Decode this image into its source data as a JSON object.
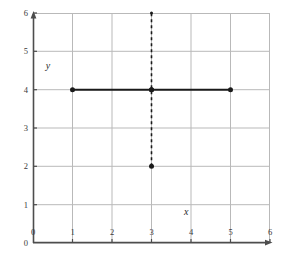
{
  "figure": {
    "width": 283,
    "height": 258,
    "background_color": "#ffffff"
  },
  "chart_data": {
    "type": "line",
    "title": "",
    "xlabel": "x",
    "ylabel": "y",
    "xlim": [
      0,
      6
    ],
    "ylim": [
      0,
      6
    ],
    "grid": true,
    "legend": "none",
    "x_ticks": [
      "0",
      "1",
      "2",
      "3",
      "4",
      "5",
      "6"
    ],
    "y_ticks": [
      "0",
      "1",
      "2",
      "3",
      "4",
      "5",
      "6"
    ],
    "x_tick_values": [
      0,
      1,
      2,
      3,
      4,
      5,
      6
    ],
    "y_tick_values": [
      0,
      1,
      2,
      3,
      4,
      5,
      6
    ],
    "series": [
      {
        "name": "horizontal-segment",
        "style": "solid",
        "color": "#1a1a1a",
        "line_width": 2,
        "x": [
          1,
          3,
          5
        ],
        "y": [
          4,
          4,
          4
        ],
        "markers": [
          {
            "x": 1,
            "y": 4,
            "size": 5
          },
          {
            "x": 3,
            "y": 4,
            "size": 5
          },
          {
            "x": 5,
            "y": 4,
            "size": 5
          }
        ]
      },
      {
        "name": "vertical-dashed-segment",
        "style": "dashed",
        "color": "#1a1a1a",
        "line_width": 1.6,
        "dash_pattern": "3 3",
        "x": [
          3,
          3,
          3
        ],
        "y": [
          2,
          4,
          6
        ],
        "markers": [
          {
            "x": 3,
            "y": 2,
            "size": 5
          },
          {
            "x": 3,
            "y": 4,
            "size": 5
          },
          {
            "x": 3,
            "y": 6,
            "size": 3
          }
        ]
      }
    ],
    "annotations": [
      {
        "text": "y",
        "x": 0.38,
        "y": 4.55,
        "style": "italic"
      },
      {
        "text": "x",
        "x": 3.88,
        "y": 0.73,
        "style": "italic"
      }
    ],
    "colors": {
      "axis": "#4d4d4d",
      "grid": "#b9b9b9",
      "data": "#1a1a1a",
      "tick_text": "#3a3a3a"
    }
  }
}
